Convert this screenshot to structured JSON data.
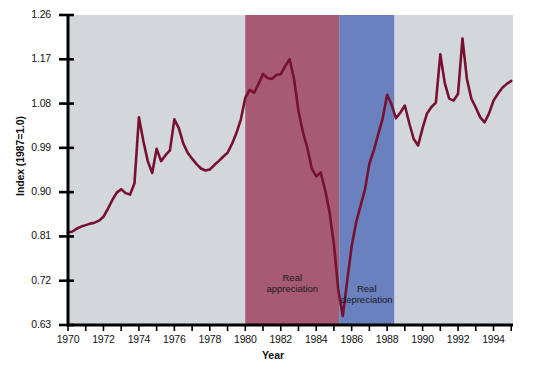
{
  "chart_data": {
    "type": "line",
    "title": "",
    "xlabel": "Year",
    "ylabel": "Index (1987=1.0)",
    "xlim": [
      1970,
      1995.1
    ],
    "ylim": [
      0.63,
      1.26
    ],
    "grid": false,
    "legend": "none",
    "line_color": "#78102f",
    "plot_bg": "#d3d7dc",
    "x_ticks_major": [
      1970,
      1972,
      1974,
      1976,
      1978,
      1980,
      1982,
      1984,
      1986,
      1988,
      1990,
      1992,
      1994
    ],
    "x_tick_labels": [
      "1970",
      "1972",
      "1974",
      "1976",
      "1978",
      "1980",
      "1982",
      "1984",
      "1986",
      "1988",
      "1990",
      "1992",
      "1994"
    ],
    "y_ticks": [
      0.63,
      0.72,
      0.81,
      0.9,
      0.99,
      1.08,
      1.17,
      1.26
    ],
    "y_tick_labels": [
      "0.63",
      "0.72",
      "0.81",
      "0.90",
      "0.99",
      "1.08",
      "1.17",
      "1.26"
    ],
    "bands": [
      {
        "name": "Real appreciation",
        "label": "Real\nappreciation",
        "label_line1": "Real",
        "label_line2": "appreciation",
        "x_start": 1980.0,
        "x_end": 1985.3,
        "color": "#a65a74"
      },
      {
        "name": "Real depreciation",
        "label": "Real\ndepreciation",
        "label_line1": "Real",
        "label_line2": "depreciation",
        "x_start": 1985.3,
        "x_end": 1988.4,
        "color": "#6a80bf"
      }
    ],
    "series": [
      {
        "name": "Real exchange rate index",
        "x": [
          1970.0,
          1970.25,
          1970.5,
          1970.75,
          1971.0,
          1971.25,
          1971.5,
          1971.75,
          1972.0,
          1972.25,
          1972.5,
          1972.75,
          1973.0,
          1973.25,
          1973.5,
          1973.75,
          1974.0,
          1974.25,
          1974.5,
          1974.75,
          1975.0,
          1975.25,
          1975.5,
          1975.75,
          1976.0,
          1976.25,
          1976.5,
          1976.75,
          1977.0,
          1977.25,
          1977.5,
          1977.75,
          1978.0,
          1978.25,
          1978.5,
          1978.75,
          1979.0,
          1979.25,
          1979.5,
          1979.75,
          1980.0,
          1980.25,
          1980.5,
          1980.75,
          1981.0,
          1981.25,
          1981.5,
          1981.75,
          1982.0,
          1982.25,
          1982.5,
          1982.75,
          1983.0,
          1983.25,
          1983.5,
          1983.75,
          1984.0,
          1984.25,
          1984.5,
          1984.75,
          1985.0,
          1985.25,
          1985.5,
          1985.75,
          1986.0,
          1986.25,
          1986.5,
          1986.75,
          1987.0,
          1987.25,
          1987.5,
          1987.75,
          1988.0,
          1988.25,
          1988.5,
          1988.75,
          1989.0,
          1989.25,
          1989.5,
          1989.75,
          1990.0,
          1990.25,
          1990.5,
          1990.75,
          1991.0,
          1991.25,
          1991.5,
          1991.75,
          1992.0,
          1992.25,
          1992.5,
          1992.75,
          1993.0,
          1993.25,
          1993.5,
          1993.75,
          1994.0,
          1994.25,
          1994.5,
          1994.75,
          1995.0
        ],
        "y": [
          0.818,
          0.82,
          0.826,
          0.83,
          0.833,
          0.836,
          0.838,
          0.842,
          0.85,
          0.866,
          0.884,
          0.899,
          0.906,
          0.898,
          0.895,
          0.918,
          1.052,
          1.004,
          0.963,
          0.939,
          0.988,
          0.963,
          0.975,
          0.985,
          1.048,
          1.03,
          0.999,
          0.98,
          0.968,
          0.957,
          0.948,
          0.944,
          0.946,
          0.955,
          0.963,
          0.972,
          0.98,
          0.998,
          1.02,
          1.048,
          1.092,
          1.108,
          1.102,
          1.12,
          1.14,
          1.132,
          1.13,
          1.138,
          1.14,
          1.156,
          1.17,
          1.13,
          1.065,
          1.022,
          0.99,
          0.948,
          0.932,
          0.94,
          0.905,
          0.86,
          0.793,
          0.7,
          0.648,
          0.72,
          0.79,
          0.838,
          0.872,
          0.905,
          0.958,
          0.985,
          1.018,
          1.05,
          1.098,
          1.078,
          1.05,
          1.062,
          1.076,
          1.04,
          1.008,
          0.995,
          1.03,
          1.06,
          1.073,
          1.082,
          1.18,
          1.122,
          1.09,
          1.086,
          1.1,
          1.212,
          1.13,
          1.09,
          1.072,
          1.052,
          1.042,
          1.06,
          1.086,
          1.1,
          1.112,
          1.12,
          1.126
        ]
      }
    ]
  },
  "axis": {
    "y_axis_title": "Index (1987=1.0)",
    "x_axis_title": "Year"
  }
}
